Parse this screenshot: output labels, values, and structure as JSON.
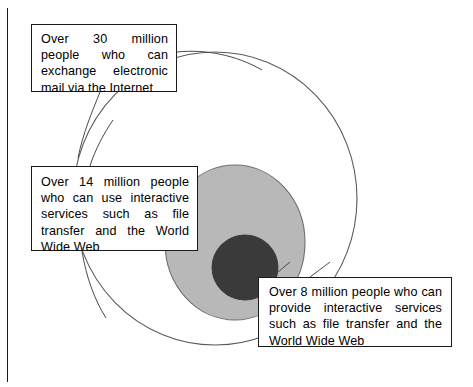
{
  "diagram": {
    "type": "nested-circles",
    "colors": {
      "outer_fill": "#ffffff",
      "middle_fill": "#b8b8b8",
      "inner_fill": "#3a3a3a",
      "stroke": "#1a1a1a",
      "box_fill": "#ffffff",
      "text": "#000000"
    },
    "circles": [
      {
        "id": "outer",
        "label": "Over 30 million people who can exchange electronic mail via the Internet",
        "value": 30,
        "unit": "million people",
        "fill": "#ffffff",
        "cx": 215,
        "cy": 198,
        "rx": 142,
        "ry": 147
      },
      {
        "id": "middle",
        "label": "Over 14 million people who can use interactive services such as file transfer and the World Wide Web",
        "value": 14,
        "unit": "million people",
        "fill": "#b8b8b8",
        "cx": 235,
        "cy": 242,
        "rx": 70,
        "ry": 78
      },
      {
        "id": "inner",
        "label": "Over 8 million people who can provide interactive services such as file transfer and the World Wide Web",
        "value": 8,
        "unit": "million people",
        "fill": "#3a3a3a",
        "cx": 245,
        "cy": 267,
        "rx": 33,
        "ry": 33
      }
    ],
    "callouts": {
      "outer": {
        "text": "Over 30 million people who can exchange electronic mail via the Internet"
      },
      "middle": {
        "text": "Over 14 million people who can use interactive services such as file transfer and the World Wide Web"
      },
      "inner": {
        "text": "Over 8 million people who can provide interactive services such as file transfer and the World Wide Web"
      }
    },
    "leader_lines": [
      {
        "id": "outer-leader",
        "from": "callout-outer-right",
        "to": "outer-circle-arc"
      },
      {
        "id": "middle-leader",
        "from": "callout-middle-top",
        "to": "outer-circle-arc"
      },
      {
        "id": "middle-leader-2",
        "from": "callout-middle-bottom",
        "to": "middle-circle-arc"
      },
      {
        "id": "inner-leader",
        "from": "callout-inner-top",
        "to": "inner-circle-arc"
      }
    ]
  }
}
